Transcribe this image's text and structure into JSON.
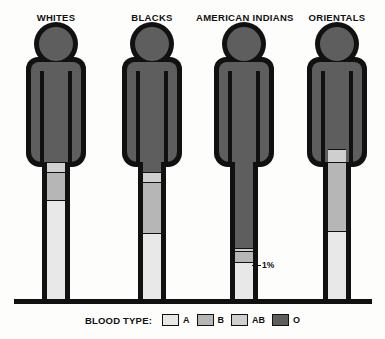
{
  "chart_data": {
    "type": "bar",
    "categories": [
      "WHITES",
      "BLACKS",
      "AMERICAN INDIANS",
      "ORIENTALS"
    ],
    "series": [
      {
        "name": "O",
        "values": [
          45,
          49,
          79,
          40
        ]
      },
      {
        "name": "AB",
        "values": [
          4,
          4,
          1,
          5
        ]
      },
      {
        "name": "B",
        "values": [
          11,
          20,
          4,
          27
        ]
      },
      {
        "name": "A",
        "values": [
          40,
          27,
          16,
          28
        ]
      }
    ],
    "xlabel": "",
    "ylabel": "Percent of population",
    "ylim": [
      0,
      100
    ],
    "grid": false,
    "legend_position": "bottom"
  },
  "legend": {
    "title": "BLOOD TYPE:",
    "items": [
      {
        "label": "A",
        "color": "#e8e8e8"
      },
      {
        "label": "B",
        "color": "#b6b6b6"
      },
      {
        "label": "AB",
        "color": "#cfcfcf"
      },
      {
        "label": "O",
        "color": "#5e5e5e"
      }
    ]
  },
  "colors": {
    "type_a": "#e8e8e8",
    "type_b": "#b6b6b6",
    "type_ab": "#cfcfcf",
    "type_o": "#5e5e5e",
    "outline": "#111111",
    "background": "#fdfdfb"
  },
  "groups": [
    {
      "name": "WHITES",
      "segments": [
        {
          "type": "O",
          "label": "45%"
        },
        {
          "type": "AB",
          "label": "4%"
        },
        {
          "type": "B",
          "label": "11%"
        },
        {
          "type": "A",
          "label": "40%"
        }
      ]
    },
    {
      "name": "BLACKS",
      "segments": [
        {
          "type": "O",
          "label": "49%"
        },
        {
          "type": "AB",
          "label": "4%"
        },
        {
          "type": "B",
          "label": "20%"
        },
        {
          "type": "A",
          "label": "27%"
        }
      ]
    },
    {
      "name": "AMERICAN INDIANS",
      "segments": [
        {
          "type": "O",
          "label": "79%"
        },
        {
          "type": "AB",
          "label": "1%"
        },
        {
          "type": "B",
          "label": "4%"
        },
        {
          "type": "A",
          "label": "16%"
        }
      ]
    },
    {
      "name": "ORIENTALS",
      "segments": [
        {
          "type": "O",
          "label": "40%"
        },
        {
          "type": "AB",
          "label": "5%"
        },
        {
          "type": "B",
          "label": "27%"
        },
        {
          "type": "A",
          "label": "28%"
        }
      ]
    }
  ]
}
